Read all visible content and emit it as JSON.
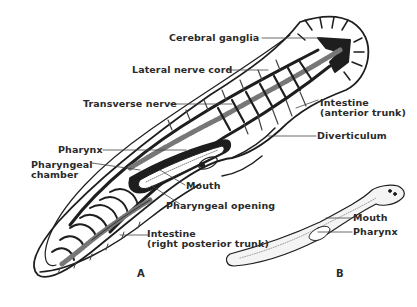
{
  "diagram": {
    "figure_a": {
      "letter": "A",
      "labels": {
        "cerebral_ganglia": "Cerebral ganglia",
        "lateral_nerve_cord": "Lateral nerve cord",
        "transverse_nerve": "Transverse nerve",
        "intestine_anterior_1": "Intestine",
        "intestine_anterior_2": "(anterior trunk)",
        "diverticulum": "Diverticulum",
        "pharynx": "Pharynx",
        "pharyngeal_chamber_1": "Pharyngeal",
        "pharyngeal_chamber_2": "chamber",
        "mouth": "Mouth",
        "pharyngeal_opening": "Pharyngeal opening",
        "intestine_posterior_1": "Intestine",
        "intestine_posterior_2": "(right posterior trunk)"
      }
    },
    "figure_b": {
      "letter": "B",
      "labels": {
        "mouth": "Mouth",
        "pharynx": "Pharynx"
      }
    },
    "colors": {
      "ink": "#1e1e1e",
      "background": "#ffffff"
    }
  }
}
